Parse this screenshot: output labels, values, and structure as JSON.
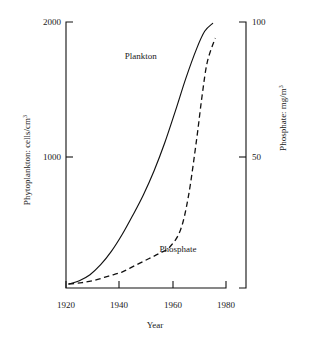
{
  "chart_data": {
    "type": "line",
    "title": "",
    "subtitle": "",
    "xlabel": "Year",
    "ylabel": "Phytoplankton: cells/cm",
    "ylabel_sup": "3",
    "y2label": "Phosphate: mg/m",
    "y2label_sup": "3",
    "xlim": [
      1920,
      1980
    ],
    "ylim": [
      0,
      2000
    ],
    "y2lim": [
      0,
      100
    ],
    "xticks": [
      "1920",
      "1940",
      "1960",
      "1980"
    ],
    "xtick_values": [
      1920,
      1940,
      1960,
      1980
    ],
    "yticks": [
      "1000",
      "2000"
    ],
    "ytick_values": [
      1000,
      2000
    ],
    "y2ticks": [
      "50",
      "100"
    ],
    "y2tick_values": [
      50,
      100
    ],
    "grid": false,
    "legend": "inline-annotations",
    "annotations": [
      {
        "text": "Plankton",
        "x": 1948,
        "y": 1720
      },
      {
        "text": "Phosphate",
        "x": 1962,
        "y": 270
      }
    ],
    "series": [
      {
        "name": "Plankton",
        "axis": "left",
        "style": "solid",
        "color": "#111111",
        "x": [
          1921,
          1925,
          1929,
          1933,
          1937,
          1941,
          1945,
          1949,
          1953,
          1957,
          1961,
          1965,
          1969,
          1972,
          1975
        ],
        "values": [
          30,
          55,
          100,
          175,
          275,
          400,
          545,
          700,
          880,
          1090,
          1330,
          1580,
          1800,
          1930,
          1990
        ]
      },
      {
        "name": "Phosphate",
        "axis": "right",
        "style": "dashed",
        "color": "#111111",
        "x": [
          1921,
          1926,
          1931,
          1936,
          1941,
          1946,
          1951,
          1955,
          1959,
          1963,
          1966,
          1969,
          1971,
          1973,
          1976
        ],
        "values": [
          1.5,
          2,
          3,
          4.5,
          6,
          8.5,
          11,
          13,
          15.5,
          22,
          35,
          56,
          72,
          85,
          94
        ]
      }
    ]
  },
  "figure": {
    "background": "#ffffff",
    "axis_color": "#111111"
  }
}
